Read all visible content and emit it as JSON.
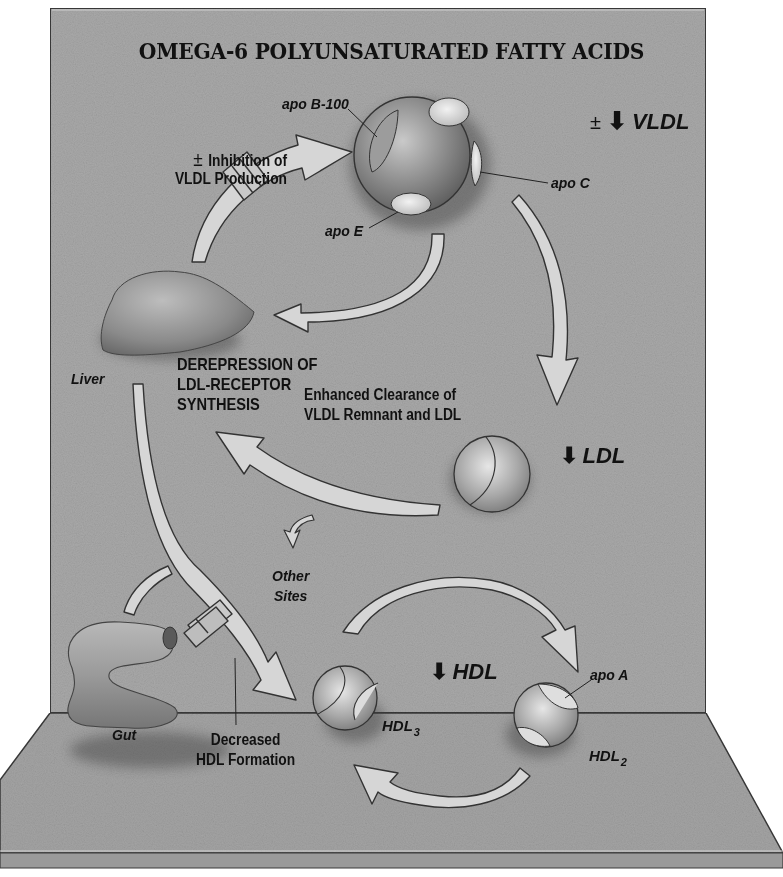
{
  "diagram": {
    "title": "OMEGA-6 POLYUNSATURATED FATTY ACIDS",
    "style": "3D display-board medical illustration, grayscale",
    "colors": {
      "backdrop": "#a9a9a9",
      "floor": "#a3a3a3",
      "outline": "#333333",
      "arrow_fill": "#d6d6d6",
      "text": "#111111",
      "page_background": "#ffffff"
    },
    "labels": {
      "inhibition_sign": "±",
      "inhibition_line1": "Inhibition of",
      "inhibition_line2": "VLDL Production",
      "apo_b100": "apo B-100",
      "apo_c": "apo C",
      "apo_e": "apo E",
      "vldl_sign": "±",
      "vldl": "VLDL",
      "liver": "Liver",
      "derepression_line1": "DEREPRESSION OF",
      "derepression_line2": "LDL-RECEPTOR",
      "derepression_line3": "SYNTHESIS",
      "clearance_line1": "Enhanced Clearance of",
      "clearance_line2": "VLDL Remnant and LDL",
      "ldl": "LDL",
      "other_sites_line1": "Other",
      "other_sites_line2": "Sites",
      "hdl": "HDL",
      "hdl3": "HDL",
      "hdl3_sub": "3",
      "hdl2": "HDL",
      "hdl2_sub": "2",
      "apo_a": "apo A",
      "gut": "Gut",
      "decreased_line1": "Decreased",
      "decreased_line2": "HDL Formation"
    },
    "indicators": {
      "vldl_arrow": "down",
      "ldl_arrow": "down",
      "hdl_arrow": "down"
    },
    "nodes": [
      {
        "id": "vldl-particle",
        "label": "VLDL",
        "apolipoproteins": [
          "apo B-100",
          "apo C",
          "apo E"
        ]
      },
      {
        "id": "liver",
        "label": "Liver"
      },
      {
        "id": "ldl-particle",
        "label": "LDL"
      },
      {
        "id": "hdl3-particle",
        "label": "HDL3"
      },
      {
        "id": "hdl2-particle",
        "label": "HDL2",
        "apolipoproteins": [
          "apo A"
        ]
      },
      {
        "id": "gut",
        "label": "Gut"
      },
      {
        "id": "other-sites",
        "label": "Other Sites"
      }
    ],
    "edges": [
      {
        "from": "liver",
        "to": "vldl-particle",
        "blocked": true,
        "note": "± Inhibition of VLDL Production"
      },
      {
        "from": "vldl-particle",
        "to": "liver",
        "blocked": false
      },
      {
        "from": "vldl-particle",
        "to": "ldl-particle",
        "blocked": false
      },
      {
        "from": "ldl-particle",
        "to": "liver",
        "blocked": false,
        "note": "Enhanced Clearance of VLDL Remnant and LDL"
      },
      {
        "from": "ldl-particle",
        "to": "other-sites",
        "blocked": false
      },
      {
        "from": "liver",
        "to": "hdl3-particle",
        "blocked": true,
        "note": "Decreased HDL Formation"
      },
      {
        "from": "gut",
        "to": "hdl3-particle",
        "blocked": true
      },
      {
        "from": "hdl3-particle",
        "to": "hdl2-particle",
        "blocked": false
      },
      {
        "from": "hdl2-particle",
        "to": "hdl3-particle",
        "blocked": false
      }
    ]
  }
}
